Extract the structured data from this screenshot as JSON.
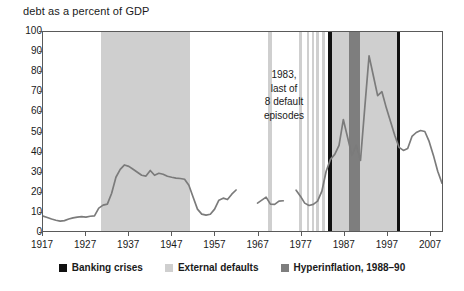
{
  "chart_data": {
    "type": "line",
    "title": "debt as a percent of GDP",
    "xlabel": "",
    "ylabel": "",
    "xlim": [
      1917,
      2010
    ],
    "ylim": [
      0,
      100
    ],
    "grid": false,
    "legend_position": "bottom",
    "y_ticks": [
      100,
      90,
      80,
      70,
      60,
      50,
      40,
      30,
      20,
      10,
      0
    ],
    "x_ticks": [
      1917,
      1927,
      1937,
      1947,
      1957,
      1967,
      1977,
      1987,
      1997,
      2007
    ],
    "series": [
      {
        "name": "debt as a percent of GDP",
        "color": "#7b7b7b",
        "segments": [
          {
            "points": [
              [
                1917,
                7.5
              ],
              [
                1918,
                6.8
              ],
              [
                1919,
                6.0
              ],
              [
                1920,
                5.4
              ],
              [
                1921,
                5.0
              ],
              [
                1922,
                5.2
              ],
              [
                1923,
                6.0
              ],
              [
                1924,
                6.6
              ],
              [
                1925,
                7.0
              ],
              [
                1926,
                7.2
              ],
              [
                1927,
                7.0
              ],
              [
                1928,
                7.4
              ],
              [
                1929,
                7.6
              ],
              [
                1930,
                11.5
              ],
              [
                1931,
                13.0
              ],
              [
                1932,
                13.5
              ],
              [
                1933,
                19.0
              ],
              [
                1934,
                27.0
              ],
              [
                1935,
                31.0
              ],
              [
                1936,
                33.2
              ],
              [
                1937,
                32.5
              ],
              [
                1938,
                31.0
              ],
              [
                1939,
                29.5
              ],
              [
                1940,
                28.0
              ],
              [
                1941,
                27.6
              ],
              [
                1942,
                30.4
              ],
              [
                1943,
                28.0
              ],
              [
                1944,
                29.0
              ],
              [
                1945,
                28.5
              ],
              [
                1946,
                27.5
              ],
              [
                1947,
                27.0
              ],
              [
                1948,
                26.6
              ],
              [
                1949,
                26.4
              ],
              [
                1950,
                26.0
              ],
              [
                1951,
                23.0
              ],
              [
                1952,
                17.0
              ],
              [
                1953,
                11.0
              ],
              [
                1954,
                8.5
              ],
              [
                1955,
                8.0
              ],
              [
                1956,
                8.4
              ],
              [
                1957,
                11.0
              ],
              [
                1958,
                15.5
              ],
              [
                1959,
                16.5
              ],
              [
                1960,
                15.8
              ],
              [
                1961,
                18.5
              ],
              [
                1962,
                20.6
              ]
            ]
          },
          {
            "points": [
              [
                1967,
                14.0
              ],
              [
                1968,
                15.5
              ],
              [
                1969,
                17.0
              ],
              [
                1970,
                13.5
              ],
              [
                1971,
                13.4
              ],
              [
                1972,
                15.0
              ],
              [
                1973,
                15.2
              ]
            ]
          },
          {
            "points": [
              [
                1976,
                20.5
              ],
              [
                1977,
                17.5
              ],
              [
                1978,
                14.0
              ],
              [
                1979,
                12.8
              ],
              [
                1980,
                13.4
              ],
              [
                1981,
                15.0
              ],
              [
                1982,
                20.0
              ],
              [
                1983,
                30.0
              ],
              [
                1984,
                36.0
              ],
              [
                1985,
                38.5
              ],
              [
                1986,
                43.0
              ],
              [
                1987,
                56.0
              ],
              [
                1988,
                47.0
              ],
              [
                1989,
                38.0
              ],
              [
                1990,
                43.0
              ],
              [
                1991,
                35.5
              ],
              [
                1992,
                62.0
              ],
              [
                1993,
                88.0
              ],
              [
                1994,
                78.0
              ],
              [
                1995,
                68.0
              ],
              [
                1996,
                70.0
              ],
              [
                1997,
                62.0
              ],
              [
                1998,
                55.0
              ],
              [
                1999,
                48.0
              ],
              [
                2000,
                42.0
              ],
              [
                2001,
                40.5
              ],
              [
                2002,
                41.5
              ],
              [
                2003,
                47.5
              ],
              [
                2004,
                49.5
              ],
              [
                2005,
                50.5
              ],
              [
                2006,
                50.0
              ],
              [
                2007,
                45.0
              ],
              [
                2008,
                38.0
              ],
              [
                2009,
                30.0
              ],
              [
                2010,
                24.0
              ],
              [
                2011,
                26.0
              ]
            ]
          }
        ]
      }
    ],
    "bands": [
      {
        "kind": "external-default",
        "start": 1930.5,
        "end": 1951.0
      },
      {
        "kind": "external-default",
        "start": 1969.2,
        "end": 1970.1
      },
      {
        "kind": "external-default",
        "start": 1976.3,
        "end": 1977.0
      },
      {
        "kind": "external-default",
        "start": 1978.2,
        "end": 1978.8
      },
      {
        "kind": "external-default",
        "start": 1979.3,
        "end": 1979.8
      },
      {
        "kind": "external-default",
        "start": 1980.4,
        "end": 1981.1
      },
      {
        "kind": "external-default",
        "start": 1981.8,
        "end": 1982.4
      },
      {
        "kind": "external-default",
        "start": 1983.4,
        "end": 1999.2
      },
      {
        "kind": "banking-crisis",
        "start": 1983.2,
        "end": 1984.0
      },
      {
        "kind": "hyperinflation",
        "start": 1988.0,
        "end": 1990.6
      },
      {
        "kind": "banking-crisis",
        "start": 1999.0,
        "end": 1999.8
      }
    ],
    "annotations": [
      {
        "name": "default-episodes-note",
        "lines": [
          "1983,",
          "last of",
          "8 default",
          "episodes"
        ]
      }
    ],
    "legend": [
      {
        "label": "Banking crises",
        "color": "#111111",
        "swatch": "banking-crisis-swatch"
      },
      {
        "label": "External defaults",
        "color": "#cfcfcf",
        "swatch": "external-defaults-swatch"
      },
      {
        "label": "Hyperinflation, 1988–90",
        "color": "#7e7e7e",
        "swatch": "hyperinflation-swatch"
      }
    ]
  }
}
